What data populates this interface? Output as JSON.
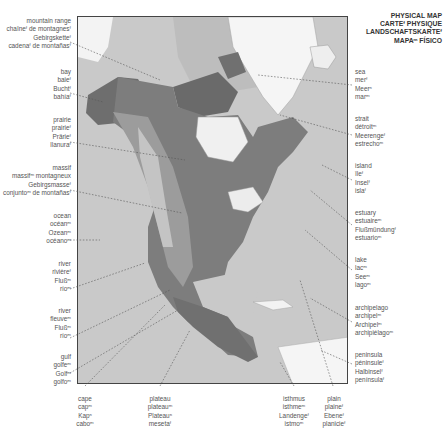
{
  "title": {
    "en": "PHYSICAL MAP",
    "fr": "CARTEᶠ PHYSIQUE",
    "de": "LANDSCHAFTSKARTEᶠ",
    "es": "MAPAᵐ FÍSICO"
  },
  "labels_left": [
    {
      "id": "mountain-range",
      "lines": [
        "mountain range",
        "chaîneᶠ de montagnesᶠ",
        "Gebirgsketteᶠ",
        "cadenaᶠ de montañasᶠ"
      ]
    },
    {
      "id": "bay",
      "lines": [
        "bay",
        "baieᶠ",
        "Buchtᶠ",
        "bahíaᶠ"
      ]
    },
    {
      "id": "prairie",
      "lines": [
        "prairie",
        "prairieᶠ",
        "Prärieᶠ",
        "llanuraᶠ"
      ]
    },
    {
      "id": "massif",
      "lines": [
        "massif",
        "massifᵐ montagneux",
        "Gebirgsmasseᶠ",
        "conjuntoᵐ de montañasᶠ"
      ]
    },
    {
      "id": "ocean",
      "lines": [
        "ocean",
        "océanᵐ",
        "Ozeanᵐ",
        "océanoᵐ"
      ]
    },
    {
      "id": "river-1",
      "lines": [
        "river",
        "rivièreᶠ",
        "Flußᵐ",
        "ríoᵐ"
      ]
    },
    {
      "id": "river-2",
      "lines": [
        "river",
        "fleuveᵐ",
        "Flußᵐ",
        "ríoᵐ"
      ]
    },
    {
      "id": "gulf",
      "lines": [
        "gulf",
        "golfeᵐ",
        "Golfᵐ",
        "golfoᵐ"
      ]
    }
  ],
  "labels_right": [
    {
      "id": "sea",
      "lines": [
        "sea",
        "merᶠ",
        "Meerⁿ",
        "marᵐ"
      ]
    },
    {
      "id": "strait",
      "lines": [
        "strait",
        "détroitᵐ",
        "Meerengeᶠ",
        "estrechoᵐ"
      ]
    },
    {
      "id": "island",
      "lines": [
        "island",
        "îleᶠ",
        "Inselᶠ",
        "islaᶠ"
      ]
    },
    {
      "id": "estuary",
      "lines": [
        "estuary",
        "estuaireᵐ",
        "Flußmündungᶠ",
        "estuarioᵐ"
      ]
    },
    {
      "id": "lake",
      "lines": [
        "lake",
        "lacᵐ",
        "Seeᵐ",
        "lagoᵐ"
      ]
    },
    {
      "id": "archipelago",
      "lines": [
        "archipelago",
        "archipelᵐ",
        "Archipelᵐ",
        "archipiélagoᵐ"
      ]
    },
    {
      "id": "peninsula",
      "lines": [
        "peninsula",
        "péninsuleᶠ",
        "Halbinselᶠ",
        "penínsulaᶠ"
      ]
    }
  ],
  "labels_bottom": [
    {
      "id": "cape",
      "lines": [
        "cape",
        "capᵐ",
        "Kapⁿ",
        "caboᵐ"
      ]
    },
    {
      "id": "plateau",
      "lines": [
        "plateau",
        "plateauᵐ",
        "Plateauⁿ",
        "mesetaᶠ"
      ]
    },
    {
      "id": "isthmus",
      "lines": [
        "isthmus",
        "isthmeᵐ",
        "Landengeᶠ",
        "istmoᵐ"
      ]
    },
    {
      "id": "plain",
      "lines": [
        "plain",
        "plaineᶠ",
        "Ebeneᶠ",
        "planicieᶠ"
      ]
    }
  ],
  "colors": {
    "frame": "#444444",
    "ocean": "#c9c9c9",
    "land_dark": "#6b6b6b",
    "land_mid": "#8e8e8e",
    "ice": "#f4f4f4",
    "leader": "#555555"
  }
}
